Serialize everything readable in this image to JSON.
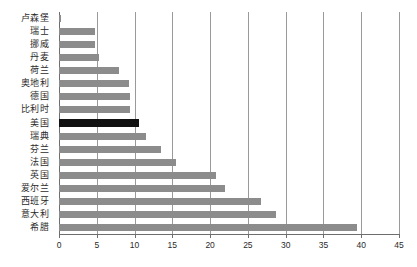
{
  "chart_data": {
    "type": "bar",
    "orientation": "horizontal",
    "title": "",
    "subtitle": "",
    "xlabel": "",
    "ylabel": "",
    "xlim": [
      0,
      45
    ],
    "ylim": null,
    "xticks": [
      0,
      5,
      10,
      15,
      20,
      25,
      30,
      35,
      40,
      45
    ],
    "xtick_labels": [
      "0",
      "5",
      "10",
      "15",
      "20",
      "25",
      "30",
      "35",
      "40",
      "45"
    ],
    "grid": "vertical",
    "legend": "none",
    "categories": [
      "卢森堡",
      "瑞士",
      "挪威",
      "丹麦",
      "荷兰",
      "奥地利",
      "德国",
      "比利时",
      "美国",
      "瑞典",
      "芬兰",
      "法国",
      "英国",
      "爱尔兰",
      "西班牙",
      "意大利",
      "希腊"
    ],
    "values": [
      0.3,
      4.7,
      4.7,
      5.3,
      8.0,
      9.3,
      9.4,
      9.4,
      10.6,
      11.5,
      13.5,
      15.5,
      20.8,
      22.0,
      26.8,
      28.7,
      39.5
    ],
    "bars": [
      {
        "label": "卢森堡",
        "value": 0.3,
        "color": "#8c8c8c",
        "highlight": false
      },
      {
        "label": "瑞士",
        "value": 4.7,
        "color": "#8c8c8c",
        "highlight": false
      },
      {
        "label": "挪威",
        "value": 4.7,
        "color": "#8c8c8c",
        "highlight": false
      },
      {
        "label": "丹麦",
        "value": 5.3,
        "color": "#8c8c8c",
        "highlight": false
      },
      {
        "label": "荷兰",
        "value": 8.0,
        "color": "#8c8c8c",
        "highlight": false
      },
      {
        "label": "奥地利",
        "value": 9.3,
        "color": "#8c8c8c",
        "highlight": false
      },
      {
        "label": "德国",
        "value": 9.4,
        "color": "#8c8c8c",
        "highlight": false
      },
      {
        "label": "比利时",
        "value": 9.4,
        "color": "#8c8c8c",
        "highlight": false
      },
      {
        "label": "美国",
        "value": 10.6,
        "color": "#111111",
        "highlight": true
      },
      {
        "label": "瑞典",
        "value": 11.5,
        "color": "#8c8c8c",
        "highlight": false
      },
      {
        "label": "芬兰",
        "value": 13.5,
        "color": "#8c8c8c",
        "highlight": false
      },
      {
        "label": "法国",
        "value": 15.5,
        "color": "#8c8c8c",
        "highlight": false
      },
      {
        "label": "英国",
        "value": 20.8,
        "color": "#8c8c8c",
        "highlight": false
      },
      {
        "label": "爱尔兰",
        "value": 22.0,
        "color": "#8c8c8c",
        "highlight": false
      },
      {
        "label": "西班牙",
        "value": 26.8,
        "color": "#8c8c8c",
        "highlight": false
      },
      {
        "label": "意大利",
        "value": 28.7,
        "color": "#8c8c8c",
        "highlight": false
      },
      {
        "label": "希腊",
        "value": 39.5,
        "color": "#8c8c8c",
        "highlight": false
      }
    ],
    "colors": {
      "bar": "#8c8c8c",
      "bar_highlight": "#111111",
      "gridline": "#9a9a9a",
      "axis": "#6e6e6e",
      "text": "#2b2b2b",
      "background": "#ffffff"
    }
  }
}
